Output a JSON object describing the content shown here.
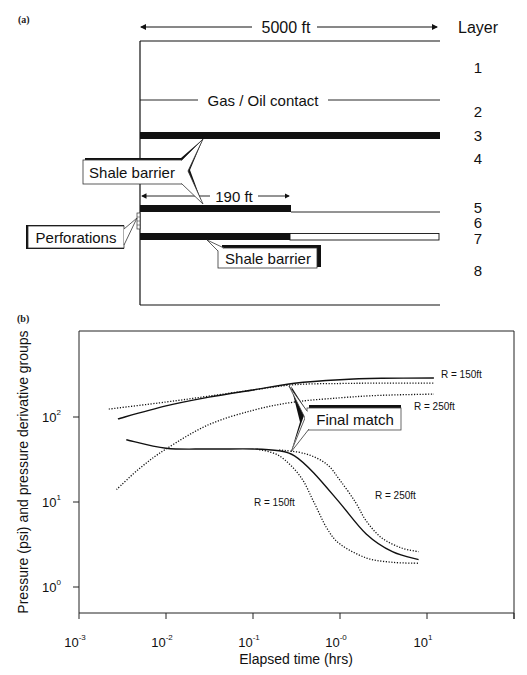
{
  "figure": {
    "panel_a": {
      "label": "(a)",
      "width_label": "5000 ft",
      "layer_header": "Layer",
      "layers": [
        "1",
        "2",
        "3",
        "4",
        "5",
        "6",
        "7",
        "8"
      ],
      "gas_oil_label": "Gas / Oil contact",
      "shale_barrier_upper": "Shale barrier",
      "shale_barrier_lower": "Shale barrier",
      "short_barrier_length": "190 ft",
      "perforations_label": "Perforations"
    },
    "panel_b": {
      "label": "(b)",
      "callout": "Final match"
    }
  },
  "chart_data": {
    "type": "line",
    "title": "",
    "xlabel": "Elapsed time (hrs)",
    "ylabel": "Pressure (psi) and pressure derivative groups",
    "xscale": "log",
    "yscale": "log",
    "xlim": [
      0.001,
      100
    ],
    "ylim": [
      0.5,
      1000
    ],
    "x_tick_labels": [
      "10^-3",
      "10^-2",
      "10^-1",
      "10^-0",
      "10^1"
    ],
    "x_tick_values": [
      0.001,
      0.01,
      0.1,
      1,
      10
    ],
    "y_tick_labels": [
      "10^0",
      "10^1",
      "10^2"
    ],
    "y_tick_values": [
      1,
      10,
      100
    ],
    "grid": false,
    "legend": null,
    "annotations": [
      "R = 150ft",
      "R = 250ft",
      "R = 150ft",
      "R = 250ft",
      "Final match"
    ],
    "series": [
      {
        "name": "Final match pressure",
        "style": "solid",
        "points": [
          [
            0.0028,
            95
          ],
          [
            0.01,
            135
          ],
          [
            0.03,
            170
          ],
          [
            0.1,
            208
          ],
          [
            0.3,
            250
          ],
          [
            1,
            275
          ],
          [
            3,
            285
          ],
          [
            12,
            288
          ]
        ]
      },
      {
        "name": "R = 150ft pressure",
        "style": "dotted",
        "points": [
          [
            0.0022,
            124
          ],
          [
            0.01,
            150
          ],
          [
            0.03,
            175
          ],
          [
            0.1,
            208
          ],
          [
            0.3,
            240
          ],
          [
            1,
            248
          ],
          [
            3,
            250
          ],
          [
            12,
            250
          ]
        ]
      },
      {
        "name": "R = 250ft pressure",
        "style": "dotted",
        "points": [
          [
            0.0027,
            14
          ],
          [
            0.005,
            25
          ],
          [
            0.01,
            42
          ],
          [
            0.03,
            80
          ],
          [
            0.1,
            120
          ],
          [
            0.3,
            150
          ],
          [
            1,
            168
          ],
          [
            3,
            180
          ],
          [
            12,
            186
          ]
        ]
      },
      {
        "name": "Final match derivative",
        "style": "solid",
        "points": [
          [
            0.0035,
            54
          ],
          [
            0.01,
            43
          ],
          [
            0.03,
            42
          ],
          [
            0.1,
            42
          ],
          [
            0.2,
            40
          ],
          [
            0.3,
            35
          ],
          [
            0.5,
            22
          ],
          [
            1,
            9.7
          ],
          [
            2,
            4.2
          ],
          [
            4,
            2.6
          ],
          [
            8,
            2.1
          ]
        ]
      },
      {
        "name": "R = 150ft derivative",
        "style": "dotted",
        "points": [
          [
            0.11,
            42
          ],
          [
            0.2,
            35
          ],
          [
            0.35,
            20
          ],
          [
            0.5,
            10
          ],
          [
            0.7,
            5
          ],
          [
            1,
            3.2
          ],
          [
            2,
            2.2
          ],
          [
            4,
            1.95
          ],
          [
            8,
            1.9
          ]
        ]
      },
      {
        "name": "R = 250ft derivative",
        "style": "dotted",
        "points": [
          [
            0.2,
            41
          ],
          [
            0.4,
            37
          ],
          [
            0.7,
            28
          ],
          [
            1,
            18
          ],
          [
            1.5,
            10
          ],
          [
            2,
            6
          ],
          [
            3,
            3.8
          ],
          [
            5,
            2.9
          ],
          [
            8,
            2.6
          ]
        ]
      }
    ]
  }
}
